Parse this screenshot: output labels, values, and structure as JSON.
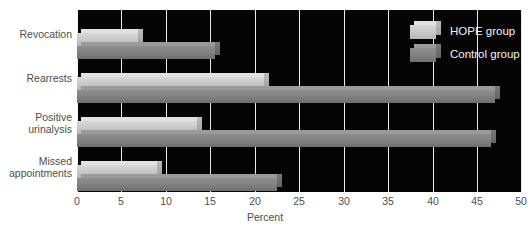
{
  "chart_data": {
    "type": "bar",
    "orientation": "horizontal",
    "title": "",
    "xlabel": "Percent",
    "ylabel": "",
    "xlim": [
      0,
      50
    ],
    "xticks": [
      0,
      5,
      10,
      15,
      20,
      25,
      30,
      35,
      40,
      45,
      50
    ],
    "xtick_labels": [
      "0",
      "5",
      "10",
      "15",
      "20",
      "25",
      "30",
      "35",
      "40",
      "45",
      "50"
    ],
    "grid": true,
    "grid_axis": "x",
    "legend_position": "top-right-inside",
    "plot_background": "#050505",
    "categories": [
      "Revocation",
      "Rearrests",
      "Positive urinalysis",
      "Missed appointments"
    ],
    "category_label_lines": [
      [
        "Revocation"
      ],
      [
        "Rearrests"
      ],
      [
        "Positive",
        "urinalysis"
      ],
      [
        "Missed",
        "appointments"
      ]
    ],
    "series": [
      {
        "name": "HOPE group",
        "color": "#cacaca",
        "values": [
          6.8,
          21,
          13.5,
          9
        ]
      },
      {
        "name": "Control group",
        "color": "#838383",
        "values": [
          15.5,
          47,
          46.5,
          22.5
        ]
      }
    ]
  },
  "legend": {
    "items": [
      {
        "label": "HOPE group",
        "swatch": "hope-swatch"
      },
      {
        "label": "Control group",
        "swatch": "control-swatch"
      }
    ]
  },
  "axis": {
    "title": "Percent"
  }
}
